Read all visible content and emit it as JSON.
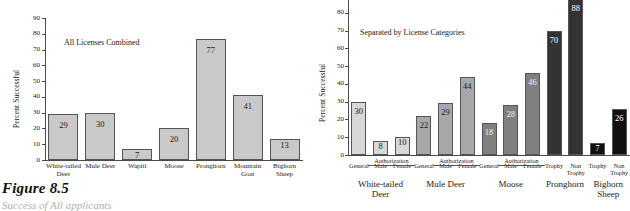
{
  "figure": {
    "caption_number": "Figure 8.5",
    "caption_text": "Success of All applicants"
  },
  "chart_data": [
    {
      "type": "bar",
      "title": "All Licenses Combined",
      "xlabel": "",
      "ylabel": "Percent Successful",
      "ylim": [
        0,
        90
      ],
      "yticks": [
        0,
        10,
        20,
        30,
        40,
        50,
        60,
        70,
        80,
        90
      ],
      "grid": false,
      "legend": "none",
      "categories": [
        "White-tailed\nDeer",
        "Mule Deer",
        "Wapiti",
        "Moose",
        "Pronghorn",
        "Mountain\nGoat",
        "Bighorn\nSheep"
      ],
      "values": [
        29,
        30,
        7,
        20,
        77,
        41,
        13
      ],
      "bar_color": "#c9c9c9",
      "bar_edge_color": "#555555",
      "value_label_color": "#1a1a1a"
    },
    {
      "type": "bar",
      "title": "Separated by License Categories",
      "xlabel": "",
      "ylabel": "Percent Successful",
      "ylim": [
        0,
        90
      ],
      "yticks": [
        0,
        10,
        20,
        30,
        40,
        50,
        60,
        70,
        80
      ],
      "grid": false,
      "legend": "none",
      "categories": [
        "General",
        "Male",
        "Female",
        "General",
        "Male",
        "Female",
        "General",
        "Male",
        "Female",
        "Trophy",
        "Non\nTrophy",
        "Trophy",
        "Non\nTrophy"
      ],
      "values": [
        30,
        8,
        10,
        22,
        29,
        44,
        18,
        28,
        46,
        70,
        88,
        7,
        26
      ],
      "groups": [
        {
          "label": "White-tailed\nDeer",
          "start": 0,
          "count": 3,
          "color": "#d8d8d8",
          "label_color": "#1a1a1a"
        },
        {
          "label": "Mule Deer",
          "start": 3,
          "count": 3,
          "color": "#a8a8a8",
          "label_color": "#1a1a1a"
        },
        {
          "label": "Moose",
          "start": 6,
          "count": 3,
          "color": "#808080",
          "label_color": "#f2f2f2"
        },
        {
          "label": "Pronghorn",
          "start": 9,
          "count": 2,
          "color": "#333333",
          "label_color": "#ffffff"
        },
        {
          "label": "Bighorn\nSheep",
          "start": 11,
          "count": 2,
          "color": "#111111",
          "label_color": "#ffffff"
        }
      ],
      "bracket_label": "Authorization",
      "bar_edge_color": "#555555"
    }
  ]
}
